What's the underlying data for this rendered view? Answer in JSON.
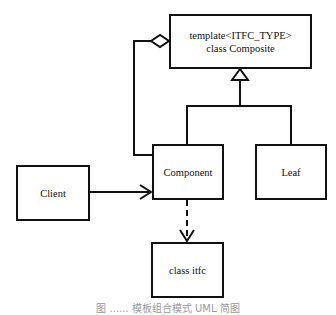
{
  "diagram": {
    "type": "UML class diagram (Composite pattern)",
    "nodes": {
      "composite": {
        "line1": "template<ITFC_TYPE>",
        "line2": "class Composite"
      },
      "client": {
        "label": "Client"
      },
      "component": {
        "label": "Component"
      },
      "leaf": {
        "label": "Leaf"
      },
      "itfc": {
        "label": "class itfc"
      }
    },
    "edges": [
      {
        "from": "component",
        "to": "composite",
        "kind": "aggregation"
      },
      {
        "from": "component",
        "to": "composite",
        "kind": "inheritance"
      },
      {
        "from": "leaf",
        "to": "composite",
        "kind": "inheritance"
      },
      {
        "from": "client",
        "to": "component",
        "kind": "association"
      },
      {
        "from": "component",
        "to": "itfc",
        "kind": "dependency"
      }
    ],
    "caption": "图 ...... 模板组合模式 UML 简图"
  },
  "colors": {
    "line": "#111111",
    "background": "#ffffff"
  }
}
